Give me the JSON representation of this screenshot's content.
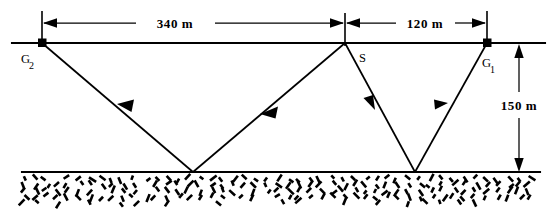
{
  "figure": {
    "type": "seismic-ray-path-diagram",
    "title_visible": false,
    "background_color": "#ffffff",
    "line_color": "#000000"
  },
  "dimensions": {
    "horizontal": [
      {
        "id": "dim-340",
        "label": "340  m",
        "value": 340,
        "unit": "m",
        "from": "G2",
        "to": "S",
        "arrow_style": "double-ended"
      },
      {
        "id": "dim-120",
        "label": "120  m",
        "value": 120,
        "unit": "m",
        "from": "S",
        "to": "G1",
        "arrow_style": "double-ended"
      }
    ],
    "vertical": [
      {
        "id": "dim-150",
        "label": "150  m",
        "value": 150,
        "unit": "m",
        "from": "surface",
        "to": "interface",
        "arrow_style": "double-ended"
      }
    ]
  },
  "stations": [
    {
      "id": "G2",
      "label": "G",
      "subscript": "2",
      "role": "geophone",
      "marker": "filled-square",
      "x": 42,
      "y": 43
    },
    {
      "id": "S",
      "label": "S",
      "subscript": "",
      "role": "source",
      "marker": "none",
      "x": 345,
      "y": 43
    },
    {
      "id": "G1",
      "label": "G",
      "subscript": "1",
      "role": "geophone",
      "marker": "filled-square",
      "x": 487,
      "y": 43
    }
  ],
  "layers": [
    {
      "id": "surface",
      "name": "ground-surface",
      "y": 43,
      "x_start": 12,
      "x_end": 545
    },
    {
      "id": "interface",
      "name": "reflector-interface",
      "y": 172,
      "x_start": 22,
      "x_end": 540
    }
  ],
  "bedrock": {
    "name": "bedrock-hatching",
    "pattern": "short-random-dashes",
    "y_top": 176,
    "y_bottom": 206,
    "x_start": 24,
    "x_end": 538
  },
  "raypaths": [
    {
      "id": "ray-left",
      "from": "S",
      "to": "G2",
      "reflection_point": {
        "x": 193,
        "y": 172
      },
      "segments": [
        {
          "from": {
            "x": 345,
            "y": 43
          },
          "to": {
            "x": 193,
            "y": 172
          },
          "arrow_at": 0.56,
          "direction": "down-left"
        },
        {
          "from": {
            "x": 193,
            "y": 172
          },
          "to": {
            "x": 42,
            "y": 43
          },
          "arrow_at": 0.53,
          "direction": "up-left"
        }
      ]
    },
    {
      "id": "ray-right",
      "from": "S",
      "to": "G1",
      "reflection_point": {
        "x": 415,
        "y": 172
      },
      "segments": [
        {
          "from": {
            "x": 345,
            "y": 43
          },
          "to": {
            "x": 415,
            "y": 172
          },
          "arrow_at": 0.42,
          "direction": "down-right"
        },
        {
          "from": {
            "x": 415,
            "y": 172
          },
          "to": {
            "x": 487,
            "y": 43
          },
          "arrow_at": 0.58,
          "direction": "up-right"
        }
      ]
    }
  ]
}
